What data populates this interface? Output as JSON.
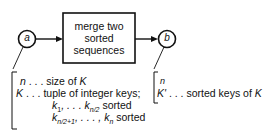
{
  "diagram": {
    "process_box": {
      "lines": [
        "merge two",
        "sorted",
        "sequences"
      ]
    },
    "input_node": {
      "label": "a"
    },
    "output_node": {
      "label": "b"
    },
    "input_annotation": {
      "line1_var": "n",
      "line1_text": " . . . size of ",
      "line1_ref": "K",
      "line2_var": "K",
      "line2_text": " . . . tuple of integer keys;",
      "line3_a": "k",
      "line3_a_sub": "1",
      "line3_mid": ", . . . k",
      "line3_b_sub": "n/2",
      "line3_end": " sorted",
      "line4_a": "k",
      "line4_a_sub": "n/2+1",
      "line4_mid": ", . . . , k",
      "line4_b_sub": "n",
      "line4_end": " sorted"
    },
    "output_annotation": {
      "line1_var": "n",
      "line2_var": "K'",
      "line2_text": " . . . sorted keys of ",
      "line2_ref": "K"
    }
  }
}
